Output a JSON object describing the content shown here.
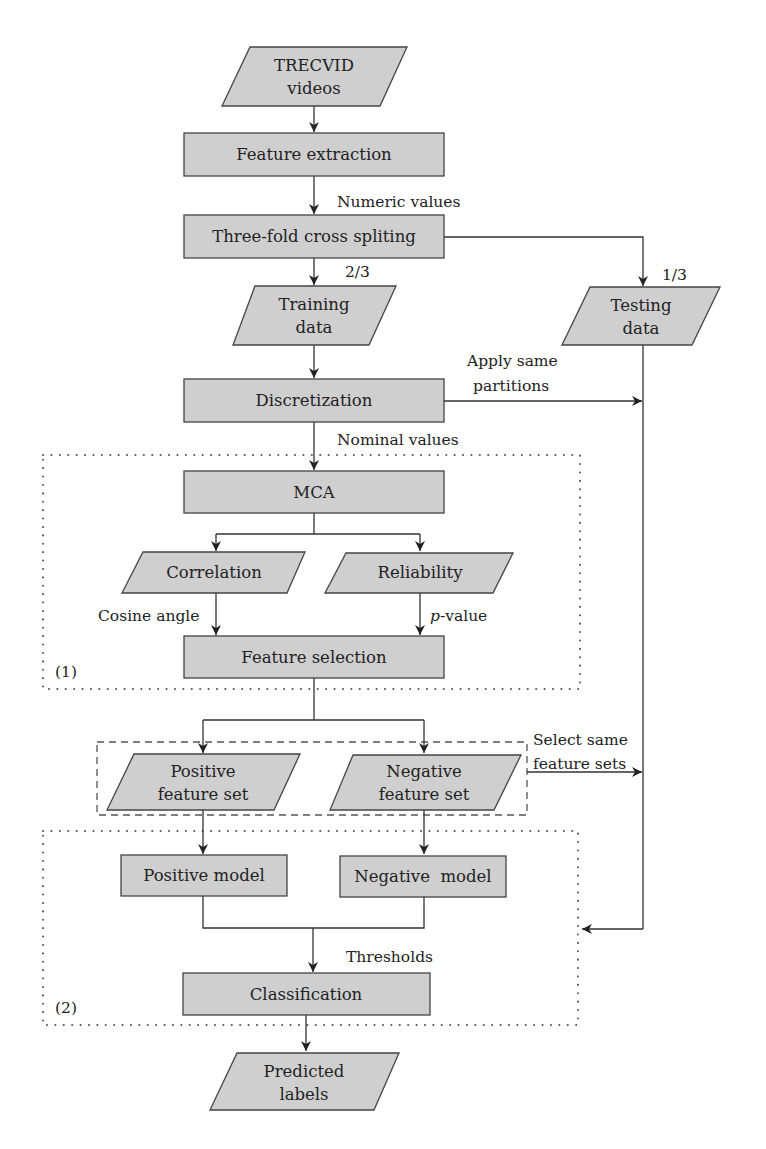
{
  "diagram": {
    "nodes": {
      "trecvid": {
        "line1": "TRECVID",
        "line2": "videos"
      },
      "feature_extraction": "Feature extraction",
      "three_fold": "Three-fold cross spliting",
      "training": {
        "line1": "Training",
        "line2": "data"
      },
      "testing": {
        "line1": "Testing",
        "line2": "data"
      },
      "discretization": "Discretization",
      "mca": "MCA",
      "correlation": "Correlation",
      "reliability": "Reliability",
      "feature_selection": "Feature selection",
      "positive_set": {
        "line1": "Positive",
        "line2": "feature set"
      },
      "negative_set": {
        "line1": "Negative",
        "line2": "feature set"
      },
      "positive_model": "Positive model",
      "negative_model": "Negative  model",
      "classification": "Classification",
      "predicted": {
        "line1": "Predicted",
        "line2": "labels"
      }
    },
    "edge_labels": {
      "numeric_values": "Numeric values",
      "two_thirds": "2/3",
      "one_third": "1/3",
      "apply_same_1": "Apply same",
      "apply_same_2": "partitions",
      "nominal_values": "Nominal values",
      "cosine_angle": "Cosine angle",
      "p_italic": "p",
      "p_value_rest": "-value",
      "select_same_1": "Select same",
      "select_same_2": "feature sets",
      "thresholds": "Thresholds"
    },
    "group_labels": {
      "group1": "(1)",
      "group2": "(2)"
    },
    "colors": {
      "node_fill": "#cfcfcf",
      "stroke": "#444444"
    }
  }
}
